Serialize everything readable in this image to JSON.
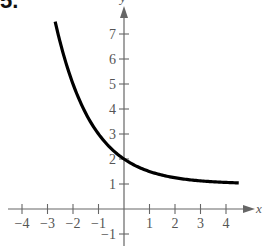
{
  "problem_label": "5.",
  "chart_data": {
    "type": "line",
    "title": "",
    "xlabel": "x",
    "ylabel": "y",
    "xlim": [
      -4.5,
      4.8
    ],
    "ylim": [
      -1.5,
      7.9
    ],
    "x_ticks": [
      -4,
      -3,
      -2,
      -1,
      1,
      2,
      3,
      4
    ],
    "y_ticks": [
      -1,
      1,
      2,
      3,
      4,
      5,
      6,
      7
    ],
    "grid": false,
    "legend": null,
    "function": "y = 1 + 2^(-x)",
    "series": [
      {
        "name": "curve",
        "x": [
          -2.7,
          -2.5,
          -2,
          -1.5,
          -1,
          -0.5,
          0,
          0.5,
          1,
          1.5,
          2,
          2.5,
          3,
          3.5,
          4,
          4.5
        ],
        "y": [
          7.5,
          6.66,
          5.0,
          3.83,
          3.0,
          2.41,
          2.0,
          1.71,
          1.5,
          1.35,
          1.25,
          1.18,
          1.13,
          1.09,
          1.06,
          1.04
        ]
      }
    ],
    "horizontal_asymptote": 1,
    "y_intercept": 2
  }
}
